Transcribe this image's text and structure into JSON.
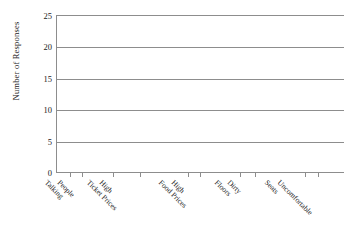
{
  "chart_data": {
    "type": "bar",
    "title": "",
    "xlabel": "",
    "ylabel": "Number of Responses",
    "categories": [
      "People Talking",
      "High Ticket Prices",
      "High Food Prices",
      "Dirty Floors",
      "Uncomfortable Seats"
    ],
    "category_lines": [
      [
        "People",
        "Talking"
      ],
      [
        "High",
        "Ticket Prices"
      ],
      [
        "High",
        "Food Prices"
      ],
      [
        "Dirty",
        "Floors"
      ],
      [
        "Uncomfortable",
        "Seats"
      ]
    ],
    "values": [
      null,
      null,
      null,
      null,
      null
    ],
    "ylim": [
      0,
      25
    ],
    "ytick_step": 5,
    "yticks": [
      "0",
      "5",
      "10",
      "15",
      "20",
      "25"
    ],
    "grid": true,
    "legend": false,
    "legend_position": "none",
    "note": "blank chart template - no bars plotted"
  },
  "axes": {
    "y_title": "Number of Responses"
  },
  "artifacts": {
    "ghost_top": "",
    "ghost_mid": "",
    "ghost_bottom": ""
  }
}
